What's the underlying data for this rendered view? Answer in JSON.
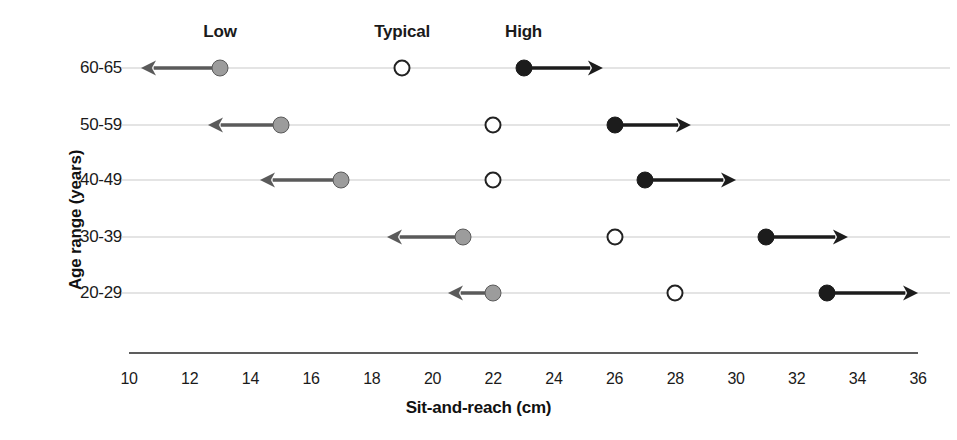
{
  "chart_data": {
    "type": "scatter",
    "title": "",
    "xlabel": "Sit-and-reach (cm)",
    "ylabel": "Age range (years)",
    "xlim": [
      10,
      36
    ],
    "xticks": [
      10,
      12,
      14,
      16,
      18,
      20,
      22,
      24,
      26,
      28,
      30,
      32,
      34,
      36
    ],
    "xticklabels": [
      "10",
      "12",
      "14",
      "16",
      "18",
      "20",
      "22",
      "24",
      "26",
      "28",
      "30",
      "32",
      "34",
      "36"
    ],
    "categories": [
      "60-65",
      "50-59",
      "40-49",
      "30-39",
      "20-29"
    ],
    "grid": true,
    "legend_position": "top-inline-headers",
    "column_headers": [
      {
        "label": "Low",
        "value": 13
      },
      {
        "label": "Typical",
        "value": 19
      },
      {
        "label": "High",
        "value": 23
      }
    ],
    "series": [
      {
        "name": "Low",
        "marker": "filled-gray-circle",
        "color": "#9c9c9c",
        "edge_color": "#5a5a5a",
        "arrow_direction": "left",
        "values": [
          13,
          15,
          17,
          21,
          22
        ]
      },
      {
        "name": "Typical",
        "marker": "open-circle",
        "color": "#ffffff",
        "edge_color": "#222222",
        "arrow_direction": "none",
        "values": [
          19,
          22,
          22,
          26,
          28
        ]
      },
      {
        "name": "High",
        "marker": "filled-black-circle",
        "color": "#1c1c1c",
        "edge_color": "#1c1c1c",
        "arrow_direction": "right",
        "values": [
          23,
          26,
          27,
          31,
          33
        ]
      }
    ],
    "rows": [
      {
        "category": "60-65",
        "low": {
          "value": 13,
          "arrow_to": 10.4
        },
        "typical": {
          "value": 19
        },
        "high": {
          "value": 23,
          "arrow_to": 25.6
        }
      },
      {
        "category": "50-59",
        "low": {
          "value": 15,
          "arrow_to": 12.6
        },
        "typical": {
          "value": 22
        },
        "high": {
          "value": 26,
          "arrow_to": 28.5
        }
      },
      {
        "category": "40-49",
        "low": {
          "value": 17,
          "arrow_to": 14.3
        },
        "typical": {
          "value": 22
        },
        "high": {
          "value": 27,
          "arrow_to": 30.0
        }
      },
      {
        "category": "30-39",
        "low": {
          "value": 21,
          "arrow_to": 18.5
        },
        "typical": {
          "value": 26
        },
        "high": {
          "value": 31,
          "arrow_to": 33.7
        }
      },
      {
        "category": "20-29",
        "low": {
          "value": 22,
          "arrow_to": 20.5
        },
        "typical": {
          "value": 28
        },
        "high": {
          "value": 33,
          "arrow_to": 36.0
        }
      }
    ],
    "colors": {
      "low_fill": "#9c9c9c",
      "low_edge": "#5a5a5a",
      "typical_fill": "#ffffff",
      "typical_edge": "#222222",
      "high_fill": "#1c1c1c",
      "gridline": "#c9c9c9",
      "axis": "#5d5d5d",
      "text": "#1a1a1a",
      "background": "#ffffff"
    },
    "layout": {
      "x_pixel_at_min": 129,
      "px_per_unit": 30.35,
      "row_y": [
        68,
        125,
        180,
        237,
        293
      ],
      "header_y": 22,
      "axis_y": 352,
      "xtick_label_y": 370,
      "xtitle_y": 398,
      "grid_right_edge": 950
    }
  }
}
